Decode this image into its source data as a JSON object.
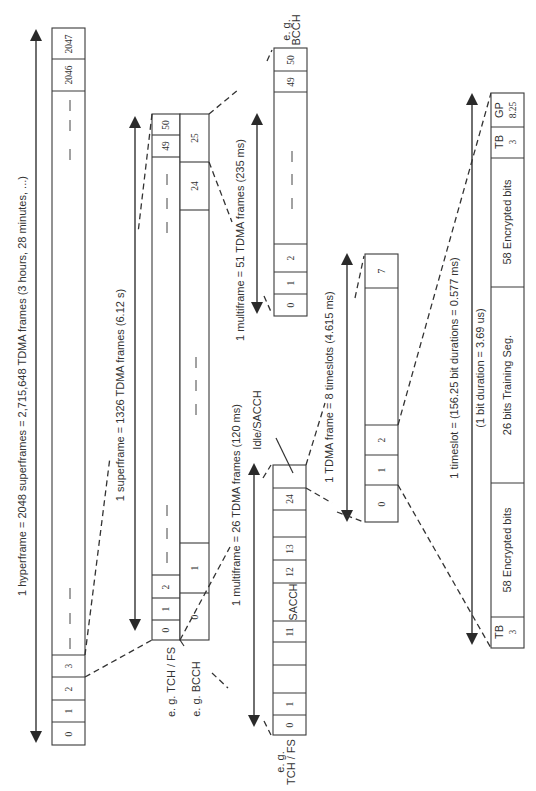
{
  "hyperframe": {
    "label": "1 hyperframe = 2048 superframes = 2,715,648 TDMA frames (3 hours, 28 minutes, ...)",
    "cells": [
      "0",
      "1",
      "2",
      "3",
      "2046",
      "2047"
    ]
  },
  "superframe": {
    "label": "1 superframe = 1326 TDMA frames (6.12 s)",
    "left_cells": [
      "0",
      "1",
      "2",
      "49",
      "50"
    ],
    "right_cells": [
      "0",
      "1",
      "24",
      "25"
    ],
    "left_note": "e. g. TCH / FS",
    "right_note": "e. g. BCCH"
  },
  "multiframe51": {
    "label": "1 multiframe = 51 TDMA frames (235 ms)",
    "cells": [
      "0",
      "1",
      "2",
      "49",
      "50"
    ],
    "note_line1": "e. g.",
    "note_line2": "BCCH"
  },
  "multiframe26": {
    "label": "1 multiframe = 26 TDMA frames (120 ms)",
    "cells": [
      "0",
      "1",
      "11",
      "SACCH",
      "12",
      "13",
      "24"
    ],
    "idle_label": "Idle/SACCH",
    "note_line1": "e. g.",
    "note_line2": "TCH / FS"
  },
  "tdma_frame": {
    "label": "1 TDMA frame = 8 timeslots (4.615 ms)",
    "cells": [
      "0",
      "1",
      "2",
      "7"
    ]
  },
  "timeslot": {
    "label": "1 timeslot = (156.25 bit durations = 0.577 ms)",
    "sublabel": "(1 bit duration = 3.69 us)",
    "fields": [
      {
        "name": "TB",
        "bits": "3"
      },
      {
        "name": "58 Encrypted bits"
      },
      {
        "name": "26 bits Training Seg."
      },
      {
        "name": "58 Encrypted bits"
      },
      {
        "name": "TB",
        "bits": "3"
      },
      {
        "name": "GP",
        "bits": "8.25"
      }
    ]
  },
  "colors": {
    "line": "#333333",
    "background": "#ffffff"
  }
}
